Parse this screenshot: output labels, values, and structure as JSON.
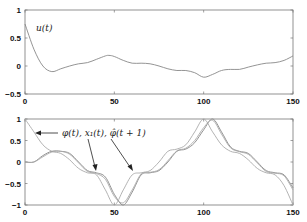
{
  "chart_data": [
    {
      "type": "line",
      "title": "",
      "annotation": "u(t)",
      "xlabel": "",
      "ylabel": "",
      "xlim": [
        0,
        150
      ],
      "ylim": [
        -0.5,
        1
      ],
      "xticks": [
        "0",
        "50",
        "100",
        "150"
      ],
      "yticks": [
        "1",
        "0.5",
        "0",
        "-0.5"
      ],
      "grid": false,
      "series": [
        {
          "name": "u(t)",
          "x": [
            0,
            5,
            10,
            15,
            20,
            25,
            30,
            35,
            40,
            45,
            47,
            50,
            55,
            60,
            65,
            70,
            75,
            80,
            85,
            90,
            95,
            100,
            105,
            110,
            115,
            120,
            125,
            130,
            135,
            140,
            145,
            150
          ],
          "values": [
            0.75,
            0.3,
            0.0,
            -0.1,
            -0.05,
            0.0,
            0.04,
            0.06,
            0.12,
            0.18,
            0.19,
            0.17,
            0.1,
            0.05,
            0.05,
            0.04,
            0.0,
            -0.05,
            -0.08,
            -0.08,
            -0.12,
            -0.2,
            -0.15,
            -0.08,
            -0.06,
            -0.06,
            -0.02,
            0.02,
            0.05,
            0.06,
            0.1,
            0.18
          ]
        }
      ]
    },
    {
      "type": "line",
      "title": "",
      "annotation": "φ(t), x1(t), φ̂(t+1)",
      "xlabel": "",
      "ylabel": "",
      "xlim": [
        0,
        150
      ],
      "ylim": [
        -1,
        1
      ],
      "xticks": [
        "0",
        "50",
        "100",
        "150"
      ],
      "yticks": [
        "1",
        "0.5",
        "0",
        "-0.5",
        "-1"
      ],
      "grid": false,
      "series": [
        {
          "name": "φ(t)",
          "x": [
            0,
            5,
            10,
            15,
            20,
            25,
            30,
            35,
            40,
            45,
            50,
            55,
            60,
            65,
            70,
            75,
            80,
            85,
            90,
            95,
            100,
            105,
            110,
            115,
            120,
            125,
            130,
            135,
            140,
            145,
            150
          ],
          "values": [
            1.0,
            0.7,
            0.4,
            0.25,
            0.2,
            0.05,
            -0.15,
            -0.25,
            -0.3,
            -0.65,
            -1.0,
            -0.65,
            -0.3,
            -0.25,
            -0.2,
            0.0,
            0.25,
            0.3,
            0.4,
            0.7,
            1.0,
            0.7,
            0.4,
            0.25,
            0.2,
            0.05,
            -0.15,
            -0.25,
            -0.3,
            -0.55,
            -1.0
          ]
        },
        {
          "name": "x1(t)",
          "x": [
            0,
            5,
            10,
            15,
            20,
            25,
            30,
            35,
            40,
            45,
            50,
            55,
            60,
            65,
            70,
            75,
            80,
            85,
            90,
            95,
            100,
            105,
            110,
            115,
            120,
            125,
            130,
            135,
            140,
            145,
            150
          ],
          "values": [
            0.0,
            0.0,
            0.15,
            0.25,
            0.25,
            0.2,
            0.0,
            -0.2,
            -0.25,
            -0.35,
            -0.75,
            -1.0,
            -0.7,
            -0.3,
            -0.25,
            -0.2,
            0.0,
            0.25,
            0.3,
            0.45,
            0.75,
            1.0,
            0.7,
            0.35,
            0.25,
            0.2,
            0.0,
            -0.2,
            -0.25,
            -0.3,
            -0.6
          ]
        },
        {
          "name": "φ̂(t+1)",
          "x": [
            0,
            5,
            10,
            15,
            20,
            25,
            30,
            35,
            40,
            45,
            50,
            55,
            60,
            65,
            70,
            75,
            80,
            85,
            90,
            95,
            100,
            105,
            110,
            115,
            120,
            125,
            130,
            135,
            140,
            145,
            150
          ],
          "values": [
            0.0,
            0.0,
            0.12,
            0.23,
            0.25,
            0.18,
            -0.02,
            -0.22,
            -0.27,
            -0.4,
            -0.8,
            -0.95,
            -0.65,
            -0.28,
            -0.24,
            -0.18,
            0.03,
            0.26,
            0.32,
            0.5,
            0.8,
            0.97,
            0.65,
            0.33,
            0.24,
            0.18,
            -0.02,
            -0.22,
            -0.26,
            -0.32,
            -0.65
          ]
        }
      ]
    }
  ],
  "labels": {
    "top_annotation": "u(t)",
    "bottom_annotation": "φ(t), x₁(t), φ̂(t + 1)",
    "top_xticks": [
      "0",
      "50",
      "100",
      "150"
    ],
    "top_yticks": [
      "1",
      "0.5",
      "0",
      "−0.5"
    ],
    "bottom_xticks": [
      "0",
      "50",
      "100",
      "150"
    ],
    "bottom_yticks": [
      "1",
      "0.5",
      "0",
      "−0.5",
      "−1"
    ]
  }
}
